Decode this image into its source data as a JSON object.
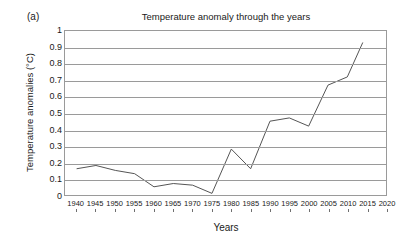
{
  "figure": {
    "panel_label": "(a)",
    "title": "Temperature anomaly through the years",
    "xlabel": "Years",
    "ylabel": "Temperature anomalies (°C)"
  },
  "chart_data": {
    "type": "line",
    "title": "Temperature anomaly through the years",
    "xlabel": "Years",
    "ylabel": "Temperature anomalies (°C)",
    "xlim": [
      1937,
      2020
    ],
    "ylim": [
      0,
      1
    ],
    "grid": "horizontal",
    "legend": "none",
    "line_color": "#555555",
    "x_tick_labels": [
      "1940",
      "1945",
      "1950",
      "1955",
      "1960",
      "1965",
      "1970",
      "1975",
      "1980",
      "1985",
      "1990",
      "1995",
      "2000",
      "2005",
      "2010",
      "2015",
      "2020"
    ],
    "x_ticks": [
      1940,
      1945,
      1950,
      1955,
      1960,
      1965,
      1970,
      1975,
      1980,
      1985,
      1990,
      1995,
      2000,
      2005,
      2010,
      2015,
      2020
    ],
    "y_tick_labels": [
      "0",
      "0.1",
      "0.2",
      "0.3",
      "0.4",
      "0.5",
      "0.6",
      "0.7",
      "0.8",
      "0.9",
      "1"
    ],
    "y_ticks": [
      0,
      0.1,
      0.2,
      0.3,
      0.4,
      0.5,
      0.6,
      0.7,
      0.8,
      0.9,
      1
    ],
    "series": [
      {
        "name": "Temperature anomaly",
        "x": [
          1940,
          1945,
          1950,
          1955,
          1960,
          1965,
          1970,
          1975,
          1980,
          1985,
          1990,
          1995,
          2000,
          2005,
          2010,
          2014
        ],
        "values": [
          0.16,
          0.18,
          0.15,
          0.13,
          0.05,
          0.07,
          0.06,
          0.01,
          0.28,
          0.16,
          0.45,
          0.47,
          0.42,
          0.67,
          0.72,
          0.93
        ]
      }
    ]
  }
}
